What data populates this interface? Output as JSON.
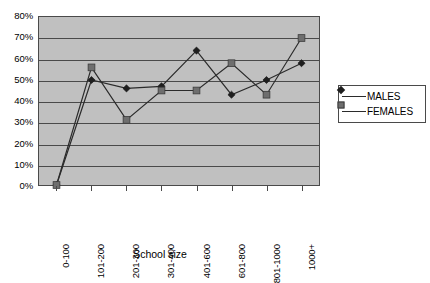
{
  "chart_data": {
    "type": "line",
    "title": "",
    "xlabel": "School size",
    "ylabel": "",
    "categories": [
      "0-100",
      "101-200",
      "201-300",
      "301-400",
      "401-600",
      "601-800",
      "801-1000",
      "1000+"
    ],
    "series": [
      {
        "name": "MALES",
        "marker": "diamond",
        "color": "#1e1e1e",
        "values": [
          0,
          50,
          46,
          47,
          64,
          43,
          50,
          58
        ]
      },
      {
        "name": "FEMALES",
        "marker": "square",
        "color": "#6e6e6e",
        "values": [
          0,
          56,
          31,
          45,
          45,
          58,
          43,
          70
        ]
      }
    ],
    "ylim": [
      0,
      80
    ],
    "yticks": [
      "0%",
      "10%",
      "20%",
      "30%",
      "40%",
      "50%",
      "60%",
      "70%",
      "80%"
    ],
    "ytick_values": [
      0,
      10,
      20,
      30,
      40,
      50,
      60,
      70,
      80
    ],
    "grid": true,
    "legend_position": "right",
    "plot_background": "#c0c0c0",
    "axis_color": "#4a4a4a",
    "value_suffix": "%"
  }
}
